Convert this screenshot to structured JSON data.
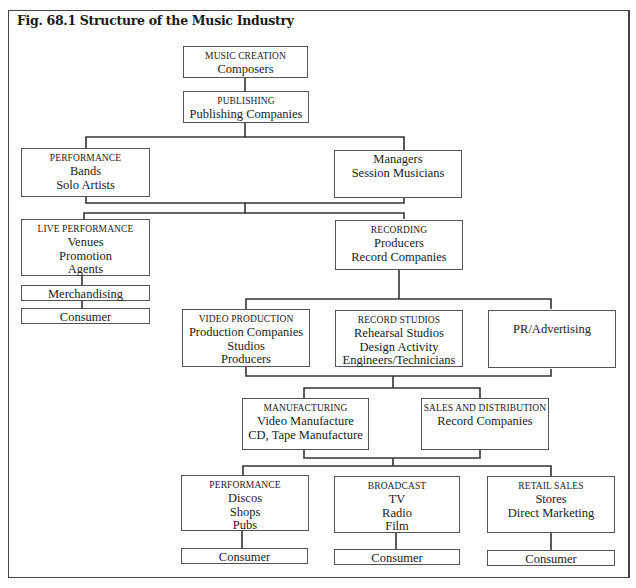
{
  "figure": {
    "title": "Fig. 68.1 Structure of the Music Industry"
  },
  "nodes": {
    "music_creation": {
      "heading": "MUSIC CREATION",
      "lines": [
        "Composers"
      ]
    },
    "publishing": {
      "heading": "PUBLISHING",
      "lines": [
        "Publishing Companies"
      ]
    },
    "performance_artists": {
      "heading": "PERFORMANCE",
      "lines": [
        "Bands",
        "Solo Artists"
      ]
    },
    "managers": {
      "heading": "",
      "lines": [
        "Managers",
        "Session Musicians"
      ]
    },
    "live_performance": {
      "heading": "LIVE PERFORMANCE",
      "lines": [
        "Venues",
        "Promotion",
        "Agents"
      ]
    },
    "merchandising": {
      "heading": "",
      "lines": [
        "Merchandising"
      ]
    },
    "consumer_live": {
      "heading": "",
      "lines": [
        "Consumer"
      ]
    },
    "recording": {
      "heading": "RECORDING",
      "lines": [
        "Producers",
        "Record Companies"
      ]
    },
    "video_production": {
      "heading": "VIDEO PRODUCTION",
      "lines": [
        "Production Companies",
        "Studios",
        "Producers"
      ]
    },
    "record_studios": {
      "heading": "RECORD STUDIOS",
      "lines": [
        "Rehearsal Studios",
        "Design Activity",
        "Engineers/Technicians"
      ]
    },
    "pr_advertising": {
      "heading": "",
      "lines": [
        "PR/Advertising"
      ]
    },
    "manufacturing": {
      "heading": "MANUFACTURING",
      "lines": [
        "Video Manufacture",
        "CD, Tape Manufacture"
      ]
    },
    "sales_distribution": {
      "heading": "SALES AND DISTRIBUTION",
      "lines": [
        "Record Companies"
      ]
    },
    "performance_venues": {
      "heading": "PERFORMANCE",
      "lines": [
        "Discos",
        "Shops",
        "Pubs"
      ]
    },
    "broadcast": {
      "heading": "BROADCAST",
      "lines": [
        "TV",
        "Radio",
        "Film"
      ]
    },
    "retail_sales": {
      "heading": "RETAIL SALES",
      "lines": [
        "Stores",
        "Direct Marketing"
      ]
    },
    "consumer_performance": {
      "heading": "",
      "lines": [
        "Consumer"
      ]
    },
    "consumer_broadcast": {
      "heading": "",
      "lines": [
        "Consumer"
      ]
    },
    "consumer_retail": {
      "heading": "",
      "lines": [
        "Consumer"
      ]
    }
  },
  "edges": [
    [
      "music_creation",
      "publishing"
    ],
    [
      "publishing",
      "performance_artists"
    ],
    [
      "publishing",
      "managers"
    ],
    [
      "performance_artists",
      "live_performance"
    ],
    [
      "performance_artists",
      "recording"
    ],
    [
      "managers",
      "live_performance"
    ],
    [
      "managers",
      "recording"
    ],
    [
      "live_performance",
      "merchandising"
    ],
    [
      "merchandising",
      "consumer_live"
    ],
    [
      "recording",
      "video_production"
    ],
    [
      "recording",
      "record_studios"
    ],
    [
      "recording",
      "pr_advertising"
    ],
    [
      "video_production",
      "manufacturing"
    ],
    [
      "video_production",
      "sales_distribution"
    ],
    [
      "pr_advertising",
      "manufacturing"
    ],
    [
      "pr_advertising",
      "sales_distribution"
    ],
    [
      "manufacturing",
      "performance_venues"
    ],
    [
      "manufacturing",
      "broadcast"
    ],
    [
      "manufacturing",
      "retail_sales"
    ],
    [
      "sales_distribution",
      "performance_venues"
    ],
    [
      "sales_distribution",
      "broadcast"
    ],
    [
      "sales_distribution",
      "retail_sales"
    ],
    [
      "performance_venues",
      "consumer_performance"
    ],
    [
      "broadcast",
      "consumer_broadcast"
    ],
    [
      "retail_sales",
      "consumer_retail"
    ]
  ]
}
